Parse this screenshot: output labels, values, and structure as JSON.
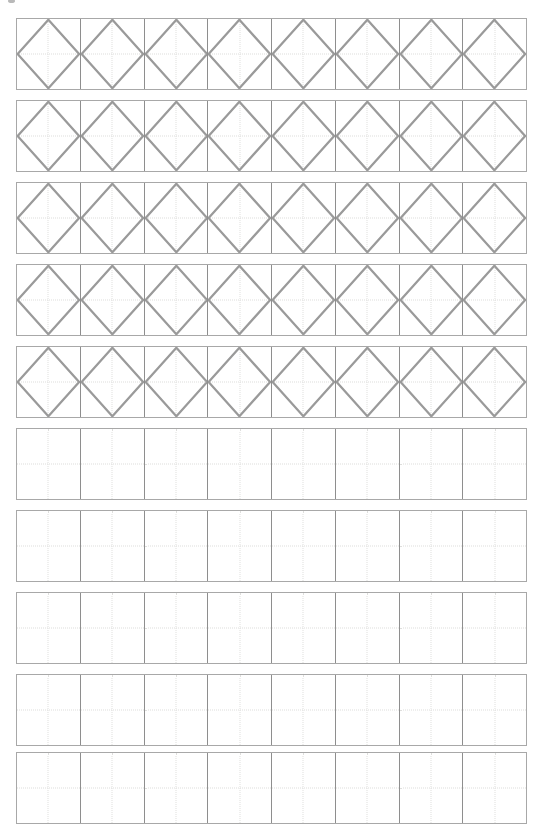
{
  "page": {
    "width": 541,
    "height": 832,
    "background_color": "#ffffff"
  },
  "header": {
    "clipped_text": "",
    "note": "Top line of page content is cut off at the image edge; only faint ink remnants are visible, no legible characters."
  },
  "colors": {
    "row_border": "#a8a8a8",
    "cell_divider": "#8e8e8e",
    "guide_line": "#dededc",
    "shape_stroke": "#9a9a9a",
    "paper": "#ffffff"
  },
  "worksheet": {
    "columns_per_row": 8,
    "row_count": 10,
    "grid_left": 16,
    "grid_width": 511,
    "row_height": 72,
    "row_gap": 10,
    "rows": [
      {
        "index": 1,
        "top": 18,
        "shape": "diamond",
        "traced": true,
        "label": "diamond-row-1"
      },
      {
        "index": 2,
        "top": 100,
        "shape": "diamond",
        "traced": true,
        "label": "diamond-row-2"
      },
      {
        "index": 3,
        "top": 182,
        "shape": "diamond",
        "traced": true,
        "label": "diamond-row-3"
      },
      {
        "index": 4,
        "top": 264,
        "shape": "diamond",
        "traced": true,
        "label": "diamond-row-4"
      },
      {
        "index": 5,
        "top": 346,
        "shape": "diamond",
        "traced": true,
        "label": "diamond-row-5"
      },
      {
        "index": 6,
        "top": 428,
        "shape": "none",
        "traced": false,
        "label": "blank-row-1"
      },
      {
        "index": 7,
        "top": 510,
        "shape": "none",
        "traced": false,
        "label": "blank-row-2"
      },
      {
        "index": 8,
        "top": 592,
        "shape": "none",
        "traced": false,
        "label": "blank-row-3"
      },
      {
        "index": 9,
        "top": 674,
        "shape": "none",
        "traced": false,
        "label": "blank-row-4"
      },
      {
        "index": 10,
        "top": 752,
        "shape": "none",
        "traced": false,
        "label": "blank-row-5"
      }
    ]
  }
}
